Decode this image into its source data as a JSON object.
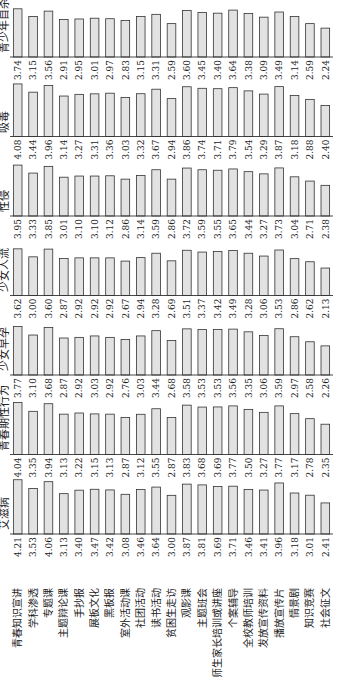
{
  "chart_data": {
    "type": "bar",
    "orientation": "rotated 90° counter-clockwise (small multiples)",
    "categories": [
      "青春知识宣讲",
      "学科渗透",
      "专题课",
      "主题辩论课",
      "手抄报",
      "展板文化",
      "黑板报",
      "室外活动课",
      "社团活动",
      "读书活动",
      "贫困生走访",
      "观影课",
      "主题班会",
      "师生家长培训或讲座",
      "个案辅导",
      "全校教师培训",
      "发放宣传资料",
      "播放宣传片",
      "情景剧",
      "知识竞赛",
      "社会征文"
    ],
    "series": [
      {
        "name": "艾滋病",
        "values": [
          4.21,
          3.53,
          4.06,
          3.13,
          3.4,
          3.47,
          3.42,
          3.08,
          3.46,
          3.64,
          3.0,
          3.87,
          3.81,
          3.69,
          3.71,
          3.46,
          3.41,
          3.96,
          3.18,
          3.01,
          2.41
        ]
      },
      {
        "name": "青春期性行为",
        "values": [
          4.04,
          3.35,
          3.94,
          3.13,
          3.22,
          3.15,
          3.13,
          2.87,
          3.12,
          3.55,
          2.87,
          3.83,
          3.68,
          3.69,
          3.77,
          3.5,
          3.27,
          3.77,
          3.17,
          2.78,
          2.35
        ]
      },
      {
        "name": "少女早孕",
        "values": [
          3.77,
          3.1,
          3.68,
          2.87,
          2.92,
          3.03,
          2.92,
          2.76,
          3.03,
          3.44,
          2.68,
          3.58,
          3.53,
          3.53,
          3.56,
          3.35,
          3.06,
          3.59,
          2.97,
          2.58,
          2.26
        ]
      },
      {
        "name": "少女人流",
        "values": [
          3.62,
          3.0,
          3.6,
          2.87,
          2.92,
          2.92,
          2.92,
          2.67,
          2.94,
          3.28,
          2.69,
          3.51,
          3.37,
          3.42,
          3.49,
          3.28,
          3.06,
          3.53,
          2.86,
          2.62,
          2.13
        ]
      },
      {
        "name": "性侵",
        "values": [
          3.95,
          3.33,
          3.85,
          3.01,
          3.1,
          3.1,
          3.12,
          2.86,
          3.14,
          3.59,
          2.86,
          3.72,
          3.59,
          3.55,
          3.65,
          3.44,
          3.27,
          3.73,
          3.04,
          2.71,
          2.38
        ]
      },
      {
        "name": "吸毒",
        "values": [
          4.08,
          3.44,
          3.96,
          3.14,
          3.27,
          3.31,
          3.36,
          3.03,
          3.32,
          3.67,
          2.94,
          3.86,
          3.74,
          3.71,
          3.79,
          3.54,
          3.29,
          3.87,
          3.18,
          2.88,
          2.4
        ]
      },
      {
        "name": "青少年自杀",
        "values": [
          3.74,
          3.15,
          3.56,
          2.91,
          2.95,
          3.01,
          2.97,
          2.83,
          3.15,
          3.31,
          2.59,
          3.6,
          3.45,
          3.4,
          3.64,
          3.38,
          3.09,
          3.49,
          3.14,
          2.59,
          2.24
        ]
      }
    ],
    "title": "",
    "xlabel": "",
    "ylabel": "",
    "ylim": [
      0,
      4.5
    ],
    "grid": false,
    "legend": "none (panel titles)"
  }
}
